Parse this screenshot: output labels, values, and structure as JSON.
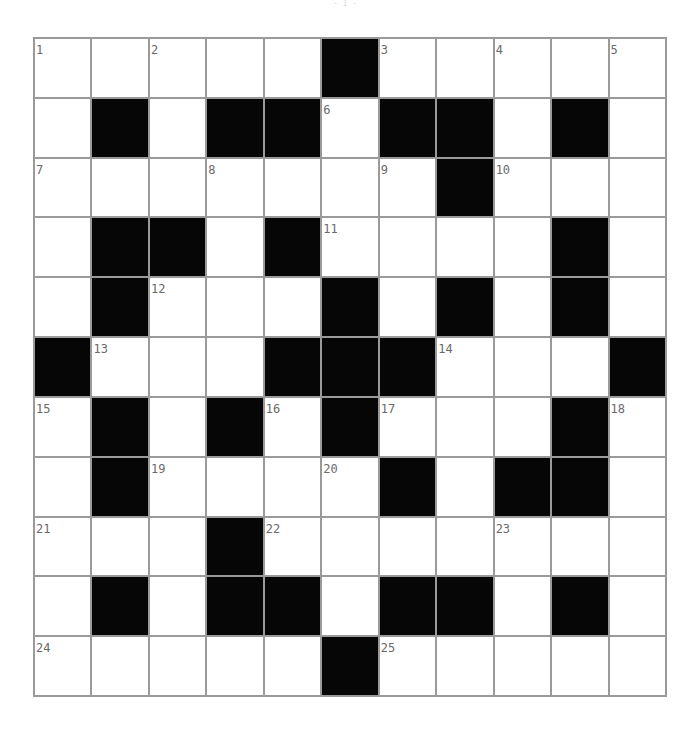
{
  "page": {
    "mark": "- 1 -"
  },
  "puzzle": {
    "rows": 11,
    "cols": 11,
    "colors": {
      "block": "#060606",
      "cell": "#ffffff",
      "gridline": "#9a9a9a",
      "number": "#6a6a6a"
    },
    "layout": [
      ".....#.....",
      ".#.##.##.#.",
      ".......#...",
      ".##.#....#.",
      ".#...#.#.#.",
      "#...###...#",
      ".#.#.#...#.",
      ".#....#.##.",
      "...#.......",
      ".#.##.##.#.",
      ".....#....."
    ],
    "numbers": [
      {
        "row": 0,
        "col": 0,
        "n": "1"
      },
      {
        "row": 0,
        "col": 2,
        "n": "2"
      },
      {
        "row": 0,
        "col": 6,
        "n": "3"
      },
      {
        "row": 0,
        "col": 8,
        "n": "4"
      },
      {
        "row": 0,
        "col": 10,
        "n": "5"
      },
      {
        "row": 1,
        "col": 5,
        "n": "6"
      },
      {
        "row": 2,
        "col": 0,
        "n": "7"
      },
      {
        "row": 2,
        "col": 3,
        "n": "8"
      },
      {
        "row": 2,
        "col": 6,
        "n": "9"
      },
      {
        "row": 2,
        "col": 8,
        "n": "10"
      },
      {
        "row": 3,
        "col": 5,
        "n": "11"
      },
      {
        "row": 4,
        "col": 2,
        "n": "12"
      },
      {
        "row": 5,
        "col": 1,
        "n": "13"
      },
      {
        "row": 5,
        "col": 7,
        "n": "14"
      },
      {
        "row": 6,
        "col": 0,
        "n": "15"
      },
      {
        "row": 6,
        "col": 4,
        "n": "16"
      },
      {
        "row": 6,
        "col": 6,
        "n": "17"
      },
      {
        "row": 6,
        "col": 10,
        "n": "18"
      },
      {
        "row": 7,
        "col": 2,
        "n": "19"
      },
      {
        "row": 7,
        "col": 5,
        "n": "20"
      },
      {
        "row": 8,
        "col": 0,
        "n": "21"
      },
      {
        "row": 8,
        "col": 4,
        "n": "22"
      },
      {
        "row": 8,
        "col": 8,
        "n": "23"
      },
      {
        "row": 10,
        "col": 0,
        "n": "24"
      },
      {
        "row": 10,
        "col": 6,
        "n": "25"
      }
    ]
  }
}
